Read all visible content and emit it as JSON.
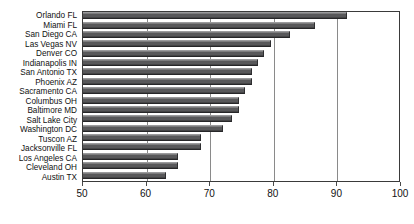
{
  "chart_data": {
    "type": "bar",
    "orientation": "horizontal",
    "title": "",
    "xlabel": "",
    "ylabel": "",
    "xlim": [
      50,
      100
    ],
    "xticks": [
      50,
      60,
      70,
      80,
      90,
      100
    ],
    "xticklabels": [
      "50",
      "60",
      "70",
      "80",
      "90",
      "100"
    ],
    "grid": true,
    "grid_axis": "x",
    "legend": false,
    "bar_color": "#58585a",
    "background_color": "#ffffff",
    "frame_color": "#3a3a3a",
    "categories": [
      "Orlando FL",
      "Miami FL",
      "San Diego CA",
      "Las Vegas NV",
      "Denver CO",
      "Indianapolis IN",
      "San Antonio TX",
      "Phoenix AZ",
      "Sacramento CA",
      "Columbus OH",
      "Baltimore MD",
      "Salt Lake City",
      "Washington DC",
      "Tuscon AZ",
      "Jacksonville FL",
      "Los Angeles CA",
      "Cleveland OH",
      "Austin TX"
    ],
    "values": [
      91.5,
      86.5,
      82.5,
      79.5,
      78.5,
      77.5,
      76.5,
      76.5,
      75.5,
      74.5,
      74.5,
      73.5,
      72.0,
      68.5,
      68.5,
      65.0,
      65.0,
      63.0
    ]
  }
}
